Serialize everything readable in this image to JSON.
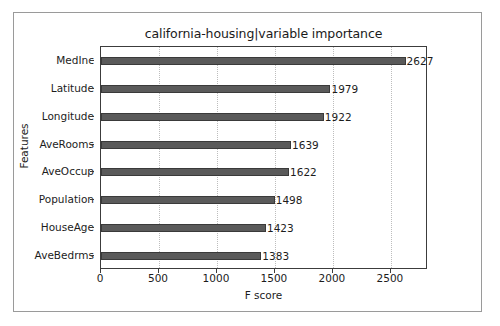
{
  "chart_data": {
    "type": "bar",
    "orientation": "horizontal",
    "title": "california-housing|variable importance",
    "xlabel": "F score",
    "ylabel": "Features",
    "categories": [
      "MedInc",
      "Latitude",
      "Longitude",
      "AveRooms",
      "AveOccup",
      "Population",
      "HouseAge",
      "AveBedrms"
    ],
    "values": [
      2627,
      1979,
      1922,
      1639,
      1622,
      1498,
      1423,
      1383
    ],
    "value_labels": [
      "2627",
      "1979",
      "1922",
      "1639",
      "1622",
      "1498",
      "1423",
      "1383"
    ],
    "xlim": [
      0,
      2820
    ],
    "xticks": [
      0,
      500,
      1000,
      1500,
      2000,
      2500
    ],
    "xtick_labels": [
      "0",
      "500",
      "1000",
      "1500",
      "2000",
      "2500"
    ],
    "grid": true,
    "grid_axis": "x",
    "legend": null,
    "bar_color": "#5a5a5a",
    "bar_edge_color": "#3a3a3a",
    "grid_color": "#bdbdbd",
    "axis_color": "#3c3c3c",
    "background": "#ffffff"
  }
}
